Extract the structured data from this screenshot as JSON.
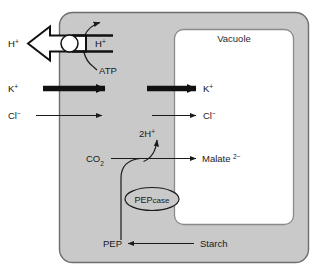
{
  "diagram": {
    "compartments": {
      "cytoplasm_fill": "#c9c9c9",
      "cytoplasm_stroke": "#6e6e6e",
      "vacuole_fill": "#ffffff",
      "vacuole_stroke": "#8a8a8a",
      "background": "#ffffff",
      "vacuole_label": "Vacuole"
    },
    "labels": {
      "h_outside": "H",
      "h_outside_charge": "+",
      "h_inside": "H",
      "h_inside_charge": "+",
      "atp": "ATP",
      "k_outside": "K",
      "k_outside_charge": "+",
      "k_inside": "K",
      "k_inside_charge": "+",
      "cl_outside": "Cl",
      "cl_outside_charge": "−",
      "cl_inside": "Cl",
      "cl_inside_charge": "−",
      "two_h": "2H",
      "two_h_charge": "+",
      "co2": "CO",
      "co2_sub": "2",
      "malate": "Malate",
      "malate_charge": "2−",
      "pepcase_main": "PEP",
      "pepcase_suffix": "case",
      "pep": "PEP",
      "starch": "Starch"
    },
    "arrows": [
      {
        "name": "proton-efflux-block-arrow",
        "style": "hollow-block",
        "direction": "left",
        "label": "H+"
      },
      {
        "name": "proton-pump-curved-arrow",
        "style": "curved-thin",
        "direction": "up-right",
        "label": "ATP-driven H+ pump"
      },
      {
        "name": "k-influx-cytoplasm-arrow",
        "style": "thick-solid",
        "direction": "right",
        "label": "K+"
      },
      {
        "name": "k-influx-vacuole-arrow",
        "style": "thick-solid",
        "direction": "right",
        "label": "K+"
      },
      {
        "name": "cl-influx-cytoplasm-arrow",
        "style": "thin-solid",
        "direction": "right",
        "label": "Cl-"
      },
      {
        "name": "cl-influx-vacuole-arrow",
        "style": "thin-solid",
        "direction": "right",
        "label": "Cl-"
      },
      {
        "name": "malate-influx-arrow",
        "style": "thin-solid",
        "direction": "right",
        "label": "Malate2-"
      },
      {
        "name": "two-proton-release-arrow",
        "style": "thin-curved",
        "direction": "up",
        "label": "2H+"
      },
      {
        "name": "co2-fixation-arrow",
        "style": "thin-solid",
        "direction": "right",
        "label": "CO2"
      },
      {
        "name": "pep-to-carboxylation-curve",
        "style": "thin-curved",
        "direction": "up",
        "label": "PEP"
      },
      {
        "name": "starch-to-pep-arrow",
        "style": "thin-solid",
        "direction": "left",
        "label": "Starch"
      }
    ],
    "enzyme": {
      "name": "PEPcase",
      "shape": "ellipse"
    }
  }
}
